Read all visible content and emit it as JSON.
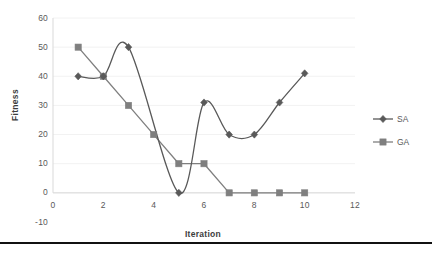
{
  "chart_data": {
    "type": "line",
    "title": "",
    "xlabel": "Iteration",
    "ylabel": "Fitness",
    "xlim": [
      0,
      12
    ],
    "ylim": [
      -10,
      60
    ],
    "xticks": [
      "0",
      "2",
      "4",
      "6",
      "8",
      "10",
      "12"
    ],
    "yticks": [
      "60",
      "50",
      "40",
      "30",
      "20",
      "10",
      "0",
      "-10"
    ],
    "grid": true,
    "grid_axis": "y",
    "legend_position": "right",
    "smoothing": "spline",
    "x": [
      1,
      2,
      3,
      4,
      5,
      6,
      7,
      8,
      9,
      10
    ],
    "series": [
      {
        "name": "SA",
        "marker": "diamond",
        "color": "#595959",
        "x": [
          1,
          2,
          3,
          5,
          6,
          7,
          8,
          9,
          10
        ],
        "values": [
          40,
          40,
          50,
          0,
          31,
          20,
          20,
          31,
          41
        ]
      },
      {
        "name": "GA",
        "marker": "square",
        "color": "#7f7f7f",
        "x": [
          1,
          2,
          3,
          4,
          5,
          6,
          7,
          8,
          9,
          10
        ],
        "values": [
          50,
          40,
          30,
          20,
          10,
          10,
          0,
          0,
          0,
          0
        ]
      }
    ]
  },
  "axis": {
    "y_title": "Fitness",
    "x_title": "Iteration",
    "y_ticks": [
      {
        "label": "60",
        "value": 60
      },
      {
        "label": "50",
        "value": 50
      },
      {
        "label": "40",
        "value": 40
      },
      {
        "label": "30",
        "value": 30
      },
      {
        "label": "20",
        "value": 20
      },
      {
        "label": "10",
        "value": 10
      },
      {
        "label": "0",
        "value": 0
      },
      {
        "label": "-10",
        "value": -10
      }
    ],
    "x_ticks": [
      {
        "label": "0",
        "value": 0
      },
      {
        "label": "2",
        "value": 2
      },
      {
        "label": "4",
        "value": 4
      },
      {
        "label": "6",
        "value": 6
      },
      {
        "label": "8",
        "value": 8
      },
      {
        "label": "10",
        "value": 10
      },
      {
        "label": "12",
        "value": 12
      }
    ]
  },
  "legend": {
    "entries": [
      {
        "label": "SA",
        "marker": "diamond",
        "color": "#595959"
      },
      {
        "label": "GA",
        "marker": "square",
        "color": "#7f7f7f"
      }
    ]
  },
  "colors": {
    "series_sa": "#595959",
    "series_ga": "#7f7f7f",
    "gridline": "#f2f2f2",
    "axis_line": "#d9d9d9",
    "text": "#595959",
    "rule": "#111111",
    "background": "#ffffff"
  }
}
